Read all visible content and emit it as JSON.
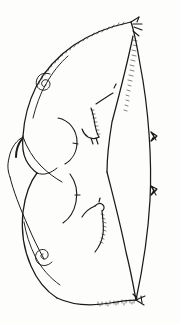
{
  "figure": {
    "domain": "Natural-Image",
    "medium": "pen-and-ink line drawing",
    "background_color": "#fdfdfb",
    "ink_color": "#1a1a1a",
    "canvas": {
      "width": 181,
      "height": 324
    },
    "caption": "",
    "label": "",
    "scale_bar": ""
  },
  "structures": {
    "outline": {
      "name": "wing-outline",
      "description": "Closed teardrop silhouette, apex at upper right, broad rounded left margin, tapering to a point at lower right",
      "apex_point": [
        131,
        22
      ],
      "basal_point": [
        136,
        300
      ]
    },
    "right_margin": {
      "name": "costal-right-margin",
      "description": "Near-straight slightly convex right edge from apex to base bearing fine setae",
      "setae_count": 2
    },
    "lobes": [
      {
        "name": "upper-lobe",
        "description": "Large dorsal lobe occupying upper two-thirds"
      },
      {
        "name": "lower-lobe",
        "description": "Smaller ventral lobe overlapping the upper lobe at left"
      }
    ],
    "notch": {
      "name": "median-notch",
      "description": "Sharp V-shaped chevron on the inner margin where the two lobes meet",
      "vertex": [
        107,
        172
      ]
    },
    "left_lobule": {
      "name": "basal-lobule",
      "description": "Small pointed accessory lobe projecting from the left margin where the lobes overlap",
      "tip": [
        8,
        175
      ]
    }
  },
  "markings": {
    "spirals": [
      {
        "name": "upper-spiral",
        "description": "Tightly coiled spiral sensillum on upper-left disc",
        "center": [
          45,
          80
        ],
        "turns": 2.5
      },
      {
        "name": "lower-spiral",
        "description": "Tightly coiled spiral sensillum on lower-left disc",
        "center": [
          42,
          254
        ],
        "turns": 2.5
      }
    ],
    "crescents": [
      {
        "name": "upper-crescent",
        "description": "Open crescent arc with a short median tick, upper-middle disc",
        "center": [
          66,
          140
        ]
      },
      {
        "name": "lower-crescent",
        "description": "Open crescent arc with a short median tick, lower-middle disc",
        "center": [
          66,
          196
        ]
      }
    ],
    "hooks": [
      {
        "name": "upper-hook",
        "description": "Angular zigzag hook with beaded shading and a detached dash above",
        "anchor": [
          98,
          112
        ]
      },
      {
        "name": "lower-hook",
        "description": "Angular zigzag hook with beaded shading, lower disc",
        "anchor": [
          97,
          216
        ]
      }
    ],
    "marginal_setae": [
      {
        "name": "apical-setae",
        "description": "Tuft of short bristles at the apex",
        "position": [
          133,
          26
        ]
      },
      {
        "name": "right-margin-seta-upper",
        "description": "Small arrow-shaped barb on right margin",
        "position": [
          150,
          138
        ]
      },
      {
        "name": "right-margin-seta-lower",
        "description": "Small arrow-shaped barb on right margin",
        "position": [
          150,
          192
        ]
      },
      {
        "name": "basal-setae",
        "description": "Forked bristle pair at the basal point",
        "position": [
          144,
          296
        ]
      }
    ],
    "fringes": [
      {
        "name": "dorsal-fringe",
        "description": "Fine hair fringe along the upper outline"
      },
      {
        "name": "ventral-fringe",
        "description": "Stippled hair fringe along the lower-right outline near the base"
      },
      {
        "name": "inner-fringe",
        "description": "Dense short hatching along the inner right edge below the apex"
      }
    ]
  }
}
